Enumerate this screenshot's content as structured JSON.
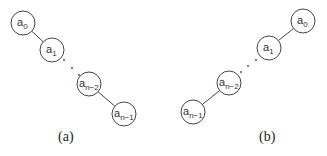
{
  "diagrams": [
    {
      "caption": "(a)",
      "nodes": [
        {
          "id": "a0",
          "base": "a",
          "sub": "0",
          "x": 23,
          "y": 23
        },
        {
          "id": "a1",
          "base": "a",
          "sub": "1",
          "x": 52,
          "y": 50
        },
        {
          "id": "an-2",
          "base": "a",
          "sub": "n−2",
          "x": 89,
          "y": 84
        },
        {
          "id": "an-1",
          "base": "a",
          "sub": "n−1",
          "x": 124,
          "y": 114
        }
      ],
      "edges": [
        [
          "a0",
          "a1"
        ],
        [
          "an-2",
          "an-1"
        ]
      ],
      "ellipsis": [
        [
          64,
          60
        ],
        [
          72,
          68
        ],
        [
          79,
          75
        ]
      ]
    },
    {
      "caption": "(b)",
      "nodes": [
        {
          "id": "a0",
          "base": "a",
          "sub": "0",
          "x": 303,
          "y": 21
        },
        {
          "id": "a1",
          "base": "a",
          "sub": "1",
          "x": 269,
          "y": 48
        },
        {
          "id": "an-2",
          "base": "a",
          "sub": "n−2",
          "x": 229,
          "y": 83
        },
        {
          "id": "an-1",
          "base": "a",
          "sub": "n−1",
          "x": 193,
          "y": 112
        }
      ],
      "edges": [
        [
          "a0",
          "a1"
        ],
        [
          "an-2",
          "an-1"
        ]
      ],
      "ellipsis": [
        [
          256,
          60
        ],
        [
          248,
          66
        ],
        [
          241,
          72
        ]
      ]
    }
  ],
  "colors": {
    "stroke": "#444444",
    "text": "#333333"
  }
}
